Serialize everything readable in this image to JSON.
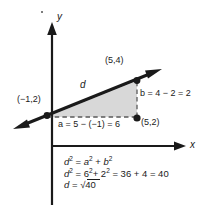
{
  "diagram": {
    "type": "coordinate-geometry-distance-formula",
    "axes": {
      "x_label": "x",
      "y_label": "y"
    },
    "points": [
      {
        "name": "point-upper-right",
        "label": "(5,4)",
        "x": 5,
        "y": 4
      },
      {
        "name": "point-left",
        "label": "(−1,2)",
        "x": -1,
        "y": 2
      },
      {
        "name": "point-lower-right",
        "label": "(5,2)",
        "x": 5,
        "y": 2
      }
    ],
    "segments": {
      "hypotenuse_label": "d",
      "horizontal_leg_label": "a = 5 − (−1) = 6",
      "vertical_leg_label": "b =  4 − 2 = 2"
    },
    "equations": [
      "d² = a² + b²",
      "d² = 6² + 2² = 36 + 4 = 40",
      "d = √40"
    ],
    "colors": {
      "ink": "#1a1a1a",
      "triangle_fill": "#d8d8d8",
      "dashed": "#555555",
      "background": "#ffffff"
    }
  }
}
